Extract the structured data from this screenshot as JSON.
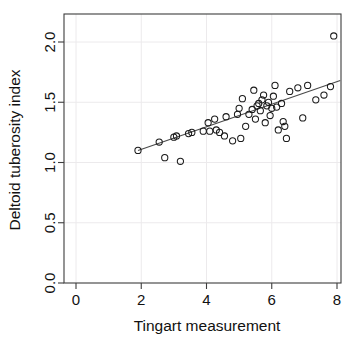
{
  "chart_data": {
    "type": "scatter",
    "title": "",
    "xlabel": "Tingart measurement",
    "ylabel": "Deltoid tuberosity index",
    "xlim": [
      -0.35,
      8.5
    ],
    "ylim": [
      -0.08,
      2.22
    ],
    "xticks": [
      0,
      2,
      4,
      6,
      8
    ],
    "xticklabels": [
      "0",
      "2",
      "4",
      "6",
      "8"
    ],
    "yticks": [
      0.0,
      0.5,
      1.0,
      1.5,
      2.0
    ],
    "yticklabels": [
      "0.0",
      "0.5",
      "1.0",
      "1.5",
      "2.0"
    ],
    "grid": true,
    "grid_color": "#eceaec",
    "legend": null,
    "marker": "open-circle",
    "marker_color": "#1a1a1a",
    "points": [
      {
        "x": 1.9,
        "y": 1.1
      },
      {
        "x": 2.55,
        "y": 1.17
      },
      {
        "x": 2.72,
        "y": 1.04
      },
      {
        "x": 3.0,
        "y": 1.21
      },
      {
        "x": 3.08,
        "y": 1.22
      },
      {
        "x": 3.2,
        "y": 1.01
      },
      {
        "x": 3.45,
        "y": 1.24
      },
      {
        "x": 3.55,
        "y": 1.25
      },
      {
        "x": 3.9,
        "y": 1.26
      },
      {
        "x": 4.05,
        "y": 1.33
      },
      {
        "x": 4.1,
        "y": 1.26
      },
      {
        "x": 4.25,
        "y": 1.36
      },
      {
        "x": 4.3,
        "y": 1.27
      },
      {
        "x": 4.4,
        "y": 1.25
      },
      {
        "x": 4.55,
        "y": 1.22
      },
      {
        "x": 4.6,
        "y": 1.38
      },
      {
        "x": 4.8,
        "y": 1.18
      },
      {
        "x": 4.95,
        "y": 1.4
      },
      {
        "x": 5.0,
        "y": 1.45
      },
      {
        "x": 5.05,
        "y": 1.2
      },
      {
        "x": 5.1,
        "y": 1.53
      },
      {
        "x": 5.2,
        "y": 1.3
      },
      {
        "x": 5.3,
        "y": 1.4
      },
      {
        "x": 5.4,
        "y": 1.44
      },
      {
        "x": 5.45,
        "y": 1.6
      },
      {
        "x": 5.5,
        "y": 1.36
      },
      {
        "x": 5.55,
        "y": 1.47
      },
      {
        "x": 5.6,
        "y": 1.49
      },
      {
        "x": 5.65,
        "y": 1.43
      },
      {
        "x": 5.7,
        "y": 1.52
      },
      {
        "x": 5.75,
        "y": 1.56
      },
      {
        "x": 5.8,
        "y": 1.33
      },
      {
        "x": 5.85,
        "y": 1.47
      },
      {
        "x": 5.9,
        "y": 1.5
      },
      {
        "x": 5.95,
        "y": 1.39
      },
      {
        "x": 6.0,
        "y": 1.45
      },
      {
        "x": 6.05,
        "y": 1.55
      },
      {
        "x": 6.1,
        "y": 1.64
      },
      {
        "x": 6.15,
        "y": 1.46
      },
      {
        "x": 6.2,
        "y": 1.27
      },
      {
        "x": 6.3,
        "y": 1.49
      },
      {
        "x": 6.35,
        "y": 1.34
      },
      {
        "x": 6.4,
        "y": 1.3
      },
      {
        "x": 6.45,
        "y": 1.2
      },
      {
        "x": 6.55,
        "y": 1.59
      },
      {
        "x": 6.8,
        "y": 1.62
      },
      {
        "x": 6.95,
        "y": 1.37
      },
      {
        "x": 7.1,
        "y": 1.64
      },
      {
        "x": 7.35,
        "y": 1.52
      },
      {
        "x": 7.6,
        "y": 1.56
      },
      {
        "x": 7.8,
        "y": 1.63
      },
      {
        "x": 7.9,
        "y": 2.05
      }
    ],
    "fit_line": {
      "type": "linear-regression",
      "x_start": 1.9,
      "x_end": 8.1,
      "y_start": 1.1,
      "y_end": 1.68
    }
  }
}
